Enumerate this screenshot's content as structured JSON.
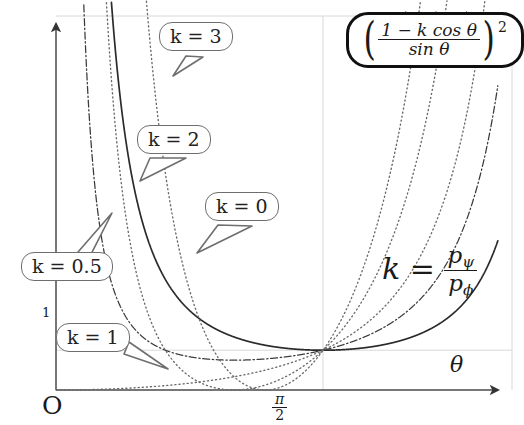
{
  "figure": {
    "kind": "function-plot",
    "formula_box": {
      "open_paren": "(",
      "numerator": "1 − k cos θ",
      "denominator": "sin θ",
      "close_paren": ")",
      "exponent": "2"
    },
    "k_ratio_label": {
      "lhs": "k",
      "equals": "=",
      "numerator_base": "p",
      "numerator_sub": "ψ",
      "denominator_base": "p",
      "denominator_sub": "ϕ"
    },
    "axes": {
      "origin_label": "O",
      "x_axis_label": "θ",
      "x_ticks": [
        {
          "label_num": "π",
          "label_den": "2",
          "value": 1.5707963
        }
      ],
      "y_ticks": [
        {
          "label": "1",
          "value": 1
        }
      ],
      "x_range": [
        0,
        2.6
      ],
      "y_range": [
        0,
        9.2
      ],
      "grid": true
    },
    "callouts": [
      {
        "id": "k3",
        "label": "k = 3",
        "left": 159,
        "top": 22,
        "tail": [
          [
            186,
            56
          ],
          [
            173,
            76
          ],
          [
            203,
            57
          ]
        ]
      },
      {
        "id": "k2",
        "label": "k = 2",
        "left": 137,
        "top": 125,
        "tail": [
          [
            150,
            158
          ],
          [
            140,
            181
          ],
          [
            186,
            158
          ]
        ]
      },
      {
        "id": "k0",
        "label": "k = 0",
        "left": 205,
        "top": 192,
        "tail": [
          [
            218,
            225
          ],
          [
            197,
            253
          ],
          [
            252,
            226
          ]
        ]
      },
      {
        "id": "k05",
        "label": "k = 0.5",
        "left": 21,
        "top": 252,
        "tail": [
          [
            78,
            252
          ],
          [
            112,
            213
          ],
          [
            84,
            268
          ]
        ]
      },
      {
        "id": "k1",
        "label": "k = 1",
        "left": 56,
        "top": 323,
        "tail": [
          [
            124,
            354
          ],
          [
            168,
            369
          ],
          [
            129,
            342
          ]
        ]
      }
    ],
    "colors": {
      "curve_solid": "#2b2b2b",
      "curve_dotted": "#6a6a6a",
      "curve_dashdot": "#3a3a3a",
      "axis": "#4a4a4a",
      "grid": "#d8d8d8",
      "callout_border": "#6e6e6e",
      "formula_border": "#101010",
      "text": "#1a1a1a"
    }
  },
  "chart_data": {
    "type": "line",
    "title": "",
    "xlabel": "θ",
    "ylabel": "",
    "expression": "((1 - k*cos(theta)) / sin(theta))^2",
    "xlim": [
      0,
      2.6
    ],
    "ylim": [
      0,
      9.2
    ],
    "grid": true,
    "xticks": [
      {
        "value": 1.5707963,
        "label": "π/2"
      }
    ],
    "yticks": [
      {
        "value": 1,
        "label": "1"
      }
    ],
    "common_point": {
      "x": 1.5707963,
      "y": 1,
      "note": "all curves pass through (π/2, 1)"
    },
    "series": [
      {
        "name": "k = 0",
        "k": 0,
        "style": "solid",
        "color": "#2b2b2b",
        "points": [
          [
            0.42,
            6.24
          ],
          [
            0.55,
            3.77
          ],
          [
            0.7,
            2.65
          ],
          [
            0.9,
            1.93
          ],
          [
            1.1,
            1.48
          ],
          [
            1.3,
            1.19
          ],
          [
            1.5708,
            1.0
          ],
          [
            1.8,
            1.06
          ],
          [
            2.0,
            1.21
          ],
          [
            2.2,
            1.51
          ],
          [
            2.4,
            2.1
          ],
          [
            2.55,
            2.94
          ]
        ]
      },
      {
        "name": "k = 0.5",
        "k": 0.5,
        "style": "dashdot",
        "color": "#3a3a3a",
        "points": [
          [
            0.18,
            7.66
          ],
          [
            0.3,
            4.52
          ],
          [
            0.5,
            2.06
          ],
          [
            0.7,
            1.12
          ],
          [
            0.9,
            0.65
          ],
          [
            1.1,
            0.42
          ],
          [
            1.3,
            0.31
          ],
          [
            1.5708,
            0.25
          ],
          [
            1.8,
            0.38
          ],
          [
            2.0,
            0.62
          ],
          [
            2.2,
            1.05
          ],
          [
            2.4,
            1.86
          ],
          [
            2.55,
            2.92
          ]
        ]
      },
      {
        "name": "k = 1",
        "k": 1,
        "style": "dotted",
        "color": "#6a6a6a",
        "points": [
          [
            0.2,
            0.01
          ],
          [
            0.4,
            0.042
          ],
          [
            0.6,
            0.096
          ],
          [
            0.8,
            0.177
          ],
          [
            1.0,
            0.289
          ],
          [
            1.2,
            0.443
          ],
          [
            1.4,
            0.658
          ],
          [
            1.5708,
            1.0
          ],
          [
            1.7,
            1.31
          ],
          [
            1.85,
            1.78
          ],
          [
            2.0,
            2.45
          ],
          [
            2.2,
            3.9
          ],
          [
            2.4,
            6.49
          ]
        ]
      },
      {
        "name": "k = 2",
        "k": 2,
        "style": "dotted",
        "color": "#6a6a6a",
        "points": [
          [
            0.3,
            8.49
          ],
          [
            0.45,
            3.4
          ],
          [
            0.6,
            1.44
          ],
          [
            0.8,
            0.45
          ],
          [
            1.0,
            0.085
          ],
          [
            1.1,
            0.03
          ],
          [
            1.2,
            0.0046
          ],
          [
            1.31,
            0.0
          ],
          [
            1.45,
            0.019
          ],
          [
            1.5708,
            1.0
          ],
          [
            1.68,
            1.96
          ],
          [
            1.8,
            3.38
          ],
          [
            1.95,
            6.02
          ],
          [
            2.05,
            8.3
          ]
        ]
      },
      {
        "name": "k = 3",
        "k": 3,
        "style": "dotted",
        "color": "#6a6a6a",
        "points": [
          [
            0.5,
            4.29
          ],
          [
            0.62,
            1.72
          ],
          [
            0.75,
            0.58
          ],
          [
            0.9,
            0.11
          ],
          [
            1.0,
            0.012
          ],
          [
            1.05,
            0.0009
          ],
          [
            1.1,
            0.0013
          ],
          [
            1.2,
            0.032
          ],
          [
            1.35,
            0.19
          ],
          [
            1.45,
            0.45
          ],
          [
            1.5708,
            1.0
          ],
          [
            1.65,
            1.64
          ],
          [
            1.75,
            2.85
          ],
          [
            1.85,
            4.62
          ],
          [
            1.95,
            7.1
          ],
          [
            2.02,
            9.1
          ]
        ]
      }
    ],
    "legend_position": "inline-callouts",
    "annotations": [
      {
        "text": "k = 3",
        "kind": "callout"
      },
      {
        "text": "k = 2",
        "kind": "callout"
      },
      {
        "text": "k = 0",
        "kind": "callout"
      },
      {
        "text": "k = 0.5",
        "kind": "callout"
      },
      {
        "text": "k = 1",
        "kind": "callout"
      },
      {
        "text": "((1 - k cos θ)/sin θ)^2",
        "kind": "formula-box"
      },
      {
        "text": "k = p_ψ / p_ϕ",
        "kind": "ratio-label"
      }
    ]
  }
}
